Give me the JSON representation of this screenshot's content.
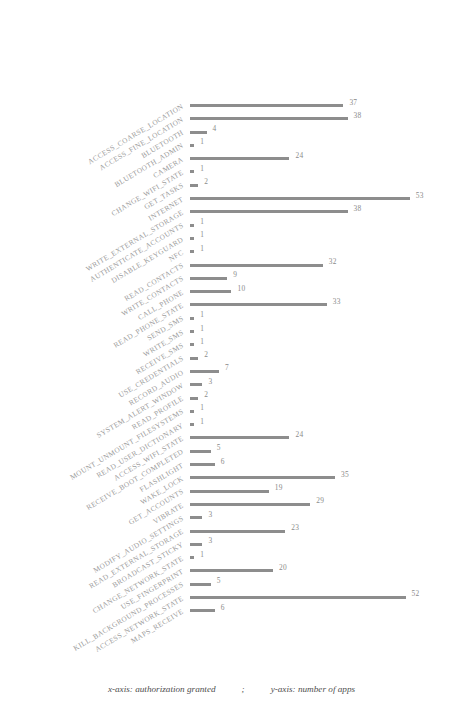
{
  "chart_data": {
    "type": "bar",
    "orientation": "horizontal",
    "title": "",
    "subtitle": "",
    "xlabel": "authorization granted",
    "ylabel": "number of apps",
    "grid": false,
    "legend": null,
    "xlim": [
      0,
      55
    ],
    "bar_color": "#8d8d8d",
    "label_color": "#9a9a9a",
    "categories": [
      "ACCESS_COARSE_LOCATION",
      "ACCESS_FINE_LOCATION",
      "BLUETOOTH",
      "BLUETOOTH_ADMIN",
      "CAMERA",
      "CHANGE_WIFI_STATE",
      "GET_TASKS",
      "INTERNET",
      "WRITE_EXTERNAL_STORAGE",
      "AUTHENTICATE_ACCOUNTS",
      "DISABLE_KEYGUARD",
      "NFC",
      "READ_CONTACTS",
      "WRITE_CONTACTS",
      "CALL_PHONE",
      "READ_PHONE_STATE",
      "SEND_SMS",
      "WRITE_SMS",
      "RECEIVE_SMS",
      "USE_CREDENTIALS",
      "RECORD_AUDIO",
      "SYSTEM_ALERT_WINDOW",
      "READ_PROFILE",
      "MOUNT_UNMOUNT_FILESYSTEMS",
      "READ_USER_DICTIONARY",
      "ACCESS_WIFI_STATE",
      "RECEIVE_BOOT_COMPLETED",
      "FLASHLIGHT",
      "WAKE_LOCK",
      "GET_ACCOUNTS",
      "VIBRATE",
      "MODIFY_AUDIO_SETTINGS",
      "READ_EXTERNAL_STORAGE",
      "BROADCAST_STICKY",
      "CHANGE_NETWORK_STATE",
      "USE_FINGERPRINT",
      "KILL_BACKGROUND_PROCESSES",
      "ACCESS_NETWORK_STATE",
      "MAPS_RECEIVE"
    ],
    "values": [
      37,
      38,
      4,
      1,
      24,
      1,
      2,
      53,
      38,
      1,
      1,
      1,
      32,
      9,
      10,
      33,
      1,
      1,
      1,
      2,
      7,
      3,
      2,
      1,
      1,
      24,
      5,
      6,
      35,
      19,
      29,
      3,
      23,
      3,
      1,
      20,
      5,
      52,
      6
    ]
  },
  "caption": {
    "x_part": "x-axis: authorization granted",
    "separator": ";",
    "y_part": "y-axis: number of apps"
  }
}
